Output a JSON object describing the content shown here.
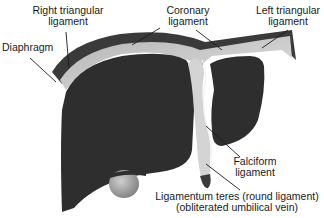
{
  "diagram": {
    "colors": {
      "liver": "#2e2e2e",
      "ligament_fill": "#c8c8c8",
      "ligament_edge": "#f2f2f2",
      "diaphragm": "#4a4a4a",
      "gallbladder": "#9a9a9a",
      "leader_line": "#1a1a1a"
    },
    "labels": {
      "right_triangular": {
        "line1": "Right triangular",
        "line2": "ligament"
      },
      "coronary": {
        "line1": "Coronary",
        "line2": "ligament"
      },
      "left_triangular": {
        "line1": "Left triangular",
        "line2": "ligament"
      },
      "diaphragm": {
        "line1": "Diaphragm"
      },
      "falciform": {
        "line1": "Falciform",
        "line2": "ligament"
      },
      "ligamentum_teres": {
        "line1": "Ligamentum teres (round ligament)",
        "line2": "(obliterated umbilical vein)"
      }
    }
  }
}
